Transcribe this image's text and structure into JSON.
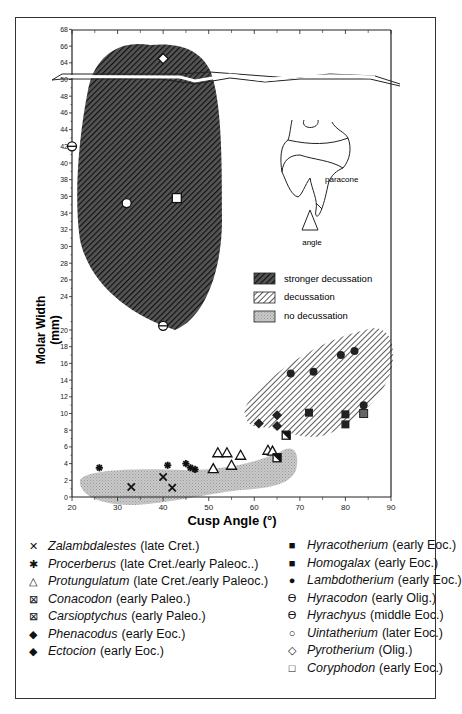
{
  "chart_data": {
    "type": "scatter",
    "title": "",
    "xlabel": "Cusp Angle (°)",
    "ylabel": "Molar Width (mm)",
    "xlim": [
      20,
      90
    ],
    "ylim": [
      0,
      68
    ],
    "y_axis_break": {
      "from": 50,
      "to": 64
    },
    "x_ticks": [
      "20",
      "30",
      "40",
      "50",
      "60",
      "70",
      "80",
      "90"
    ],
    "y_ticks": [
      "0",
      "2",
      "4",
      "6",
      "8",
      "10",
      "12",
      "14",
      "16",
      "18",
      "20",
      "24",
      "26",
      "28",
      "30",
      "32",
      "34",
      "36",
      "38",
      "40",
      "42",
      "44",
      "46",
      "48",
      "50",
      "64",
      "66",
      "68"
    ],
    "grid": false,
    "regions": [
      {
        "name": "stronger decussation",
        "pattern": "dense dark diagonal hatch"
      },
      {
        "name": "decussation",
        "pattern": "diagonal hatch"
      },
      {
        "name": "no decussation",
        "pattern": "light gray stipple"
      }
    ],
    "series": [
      {
        "name": "Zalambdalestes",
        "period": "late Cret.",
        "marker": "x",
        "points": [
          [
            33,
            1.2
          ],
          [
            40,
            2.4
          ],
          [
            42,
            1.1
          ]
        ]
      },
      {
        "name": "Procerberus",
        "period": "late Cret./early Paleoc..",
        "marker": "asterisk",
        "points": [
          [
            26,
            3.5
          ],
          [
            41,
            3.8
          ],
          [
            45,
            4.0
          ],
          [
            46,
            3.5
          ],
          [
            47,
            3.3
          ]
        ]
      },
      {
        "name": "Protungulatum",
        "period": "late Cret./early Paleoc.",
        "marker": "open-triangle",
        "points": [
          [
            51,
            3.4
          ],
          [
            52,
            5.3
          ],
          [
            54,
            5.3
          ],
          [
            55,
            3.8
          ],
          [
            57,
            5.0
          ],
          [
            63,
            5.6
          ],
          [
            64,
            5.5
          ]
        ]
      },
      {
        "name": "Conacodon",
        "period": "early Paleo.",
        "marker": "crossed-square",
        "points": [
          [
            65,
            4.7
          ]
        ]
      },
      {
        "name": "Carsioptychus",
        "period": "early Paleo.",
        "marker": "crossed-square",
        "points": [
          [
            67,
            7.4
          ]
        ]
      },
      {
        "name": "Phenacodus",
        "period": "early Eoc.",
        "marker": "filled-diamond",
        "points": [
          [
            61,
            8.8
          ],
          [
            65,
            8.5
          ]
        ]
      },
      {
        "name": "Ectocion",
        "period": "early Eoc.",
        "marker": "filled-diamond",
        "points": [
          [
            65,
            9.8
          ]
        ]
      },
      {
        "name": "Hyracotherium",
        "period": "early Eoc.",
        "marker": "filled-square",
        "points": [
          [
            72,
            10.1
          ],
          [
            80,
            9.9
          ],
          [
            80,
            8.7
          ]
        ]
      },
      {
        "name": "Homogalax",
        "period": "early Eoc.",
        "marker": "gray-square",
        "points": [
          [
            84,
            10.0
          ]
        ]
      },
      {
        "name": "Lambdotherium",
        "period": "early Eoc.",
        "marker": "filled-circle",
        "points": [
          [
            68,
            14.8
          ],
          [
            73,
            15.0
          ],
          [
            79,
            17.0
          ],
          [
            82,
            17.5
          ],
          [
            84,
            11.0
          ]
        ]
      },
      {
        "name": "Hyracodon",
        "period": "early Olig.",
        "marker": "theta",
        "points": [
          [
            20,
            42
          ]
        ]
      },
      {
        "name": "Hyrachyus",
        "period": "middle Eoc.",
        "marker": "theta",
        "points": [
          [
            40,
            20.5
          ]
        ]
      },
      {
        "name": "Uintatherium",
        "period": "later Eoc.",
        "marker": "open-circle",
        "points": [
          [
            32,
            35.2
          ]
        ]
      },
      {
        "name": "Pyrotherium",
        "period": "Olig.",
        "marker": "open-diamond",
        "points": [
          [
            40,
            64.5
          ]
        ]
      },
      {
        "name": "Coryphodon",
        "period": "early Eoc.",
        "marker": "open-square",
        "points": [
          [
            43,
            35.8
          ]
        ]
      }
    ],
    "legend_position": "inside right (regions); below plot (taxa)"
  },
  "inset": {
    "label_paracone": "paracone",
    "label_angle": "angle"
  },
  "region_legend": [
    {
      "label": "stronger decussation"
    },
    {
      "label": "decussation"
    },
    {
      "label": "no decussation"
    }
  ],
  "legend_left": [
    {
      "symbol": "✕",
      "name": "Zalambdalestes",
      "era": "(late Cret.)"
    },
    {
      "symbol": "✱",
      "name": "Procerberus",
      "era": "(late Cret./early Paleoc..)"
    },
    {
      "symbol": "△",
      "name": "Protungulatum",
      "era": "(late Cret./early Paleoc.)"
    },
    {
      "symbol": "⊠",
      "name": "Conacodon",
      "era": "(early Paleo.)"
    },
    {
      "symbol": "⊠",
      "name": "Carsioptychus",
      "era": "(early Paleo.)"
    },
    {
      "symbol": "◆",
      "name": "Phenacodus",
      "era": "(early Eoc.)"
    },
    {
      "symbol": "◆",
      "name": "Ectocion",
      "era": "(early Eoc.)"
    }
  ],
  "legend_right": [
    {
      "symbol": "■",
      "name": "Hyracotherium",
      "era": "(early Eoc.)"
    },
    {
      "symbol": "■",
      "name": "Homogalax",
      "era": "(early Eoc.)"
    },
    {
      "symbol": "●",
      "name": "Lambdotherium",
      "era": "(early Eoc.)"
    },
    {
      "symbol": "ϴ",
      "name": "Hyracodon",
      "era": "(early Olig.)"
    },
    {
      "symbol": "ϴ",
      "name": "Hyrachyus",
      "era": "(middle Eoc.)"
    },
    {
      "symbol": "○",
      "name": "Uintatherium",
      "era": "(later Eoc.)"
    },
    {
      "symbol": "◇",
      "name": "Pyrotherium",
      "era": "(Olig.)"
    },
    {
      "symbol": "□",
      "name": "Coryphodon",
      "era": "(early Eoc.)"
    }
  ]
}
